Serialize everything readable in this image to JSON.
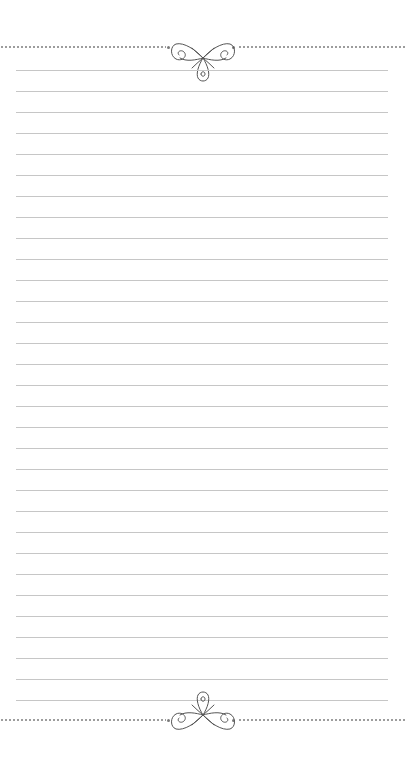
{
  "page": {
    "type": "lined-notepaper",
    "width": 406,
    "height": 761,
    "background": "#ffffff"
  },
  "rules": {
    "count": 31,
    "first_y": 70,
    "spacing": 21,
    "left": 16,
    "right": 388,
    "color": "#c6c6c6"
  },
  "top_border": {
    "style": "dotted",
    "y": 47,
    "color": "#9a9a9a",
    "ornament": "flourish-icon"
  },
  "bottom_border": {
    "style": "dotted",
    "y": 720,
    "color": "#9a9a9a",
    "ornament": "flourish-icon"
  },
  "ornament_color": "#555555"
}
